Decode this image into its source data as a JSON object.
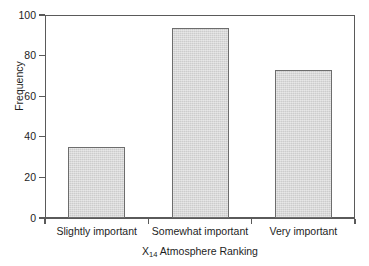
{
  "chart_data": {
    "type": "bar",
    "title": "",
    "subtitle": "",
    "categories": [
      "Slightly important",
      "Somewhat important",
      "Very important"
    ],
    "values": [
      35,
      93.5,
      73
    ],
    "xlabel_prefix": "X",
    "xlabel_subscript": "14",
    "xlabel_suffix": " Atmosphere Ranking",
    "xlabel": "X14 Atmosphere Ranking",
    "ylabel": "Frequency",
    "ylim": [
      0,
      100
    ],
    "yticks": [
      0,
      20,
      40,
      60,
      80,
      100
    ],
    "ytick_labels": [
      "0",
      "20",
      "40",
      "60",
      "80",
      "100"
    ],
    "grid": false,
    "legend": false,
    "legend_position": "none",
    "bar_fill_color": "#d4d4d4",
    "bar_edge_color": "#6d6d6d",
    "axis_color": "#5a5a5a",
    "background_color": "#ffffff",
    "text_color": "#1d1d1d"
  }
}
